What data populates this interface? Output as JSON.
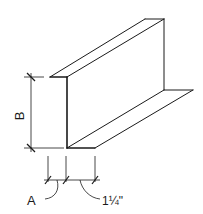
{
  "diagram": {
    "labels": {
      "height": "B",
      "web_thickness_offset": "A",
      "flange_width": "1¼\""
    },
    "colors": {
      "line": "#1a1a1a",
      "background": "#ffffff"
    }
  }
}
